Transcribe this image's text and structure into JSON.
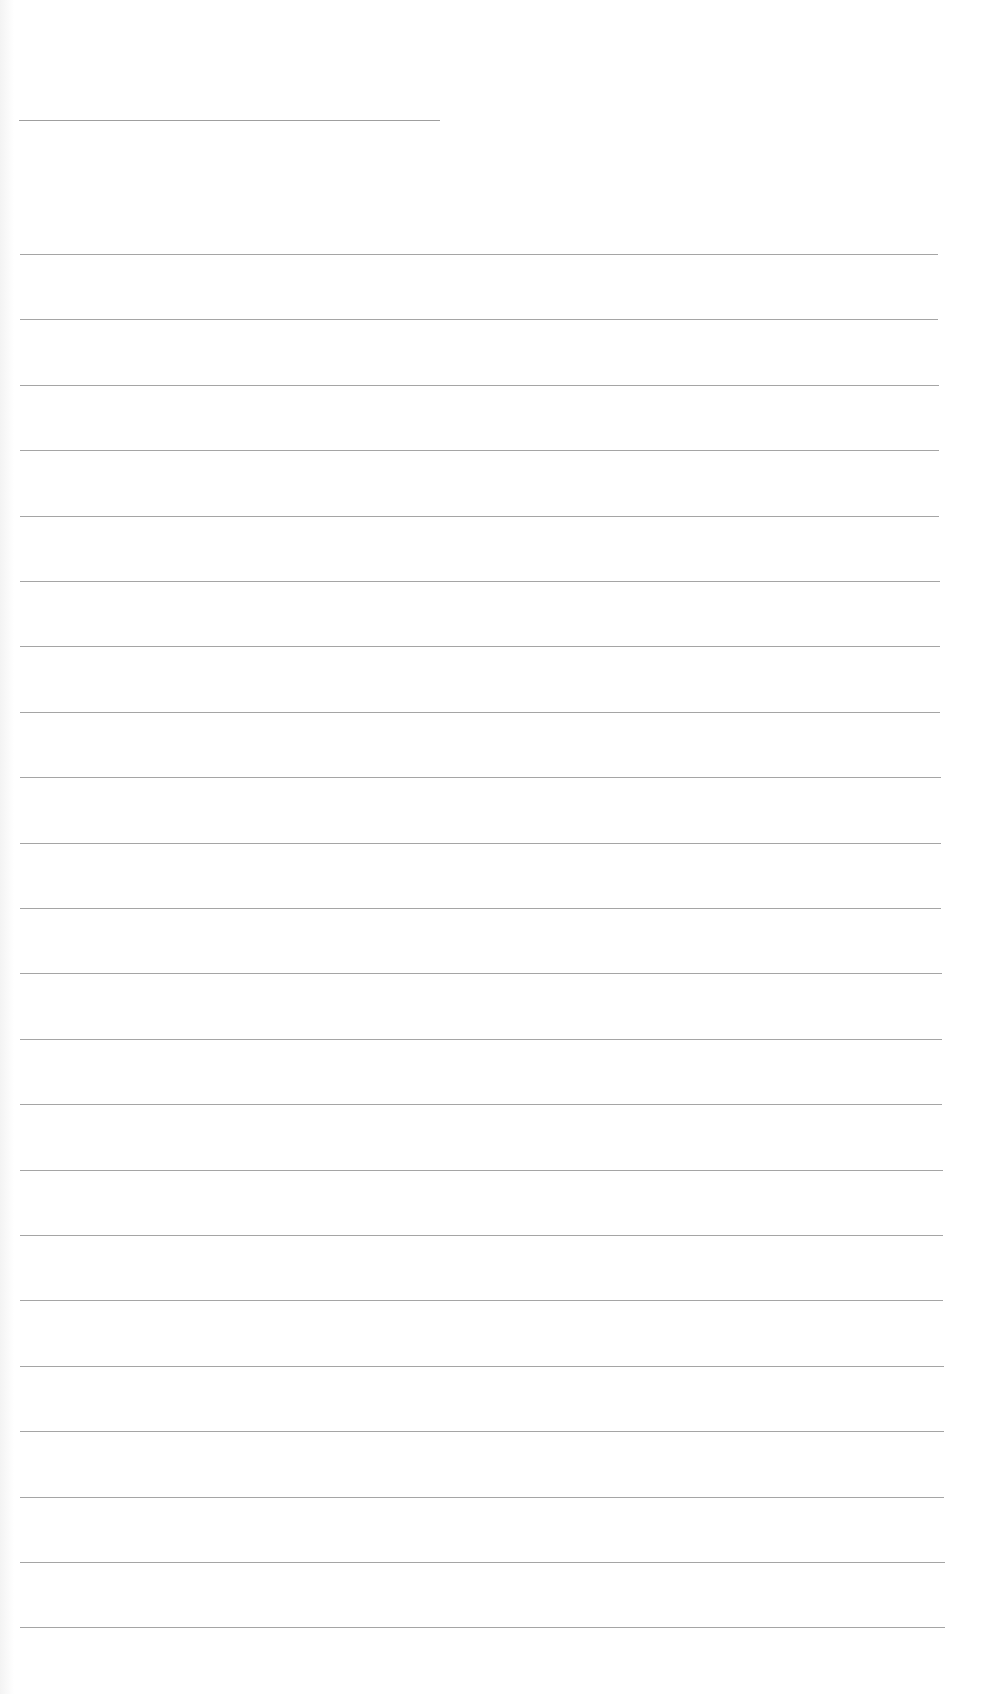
{
  "page": {
    "type": "blank ruled sheet",
    "background_color": "#ffffff",
    "line_color": "#8e8e8e",
    "header_line": {
      "x": 19,
      "y": 120,
      "width": 421
    },
    "rules": {
      "count": 22,
      "first_y": 254,
      "spacing": 65.4,
      "left": 20,
      "right_start": 938,
      "right_end": 945
    }
  }
}
